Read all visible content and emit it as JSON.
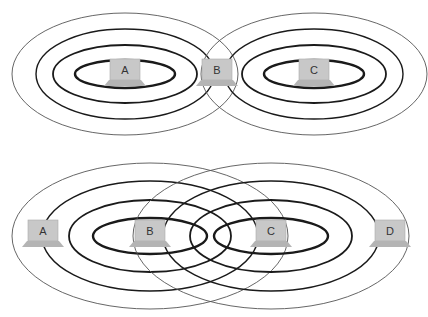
{
  "colors": {
    "background": "#ffffff",
    "ring_stroke": "#1a1a1a",
    "outer_ring_stroke": "#555555",
    "laptop_screen": "#c8c8c8",
    "laptop_base": "#b4b4b4",
    "label_text": "#333333"
  },
  "diagrams": [
    {
      "name": "top-diagram",
      "description": "Two stations A and C with nested range rings; station B sits where their outer rings overlap",
      "ranges": [
        {
          "id": "A",
          "cx": 125,
          "cy": 74,
          "rings": [
            {
              "rx": 50,
              "ry": 14,
              "w": 2.4
            },
            {
              "rx": 72,
              "ry": 29,
              "w": 1.8
            },
            {
              "rx": 89,
              "ry": 45,
              "w": 1.4
            },
            {
              "rx": 113,
              "ry": 61,
              "w": 0.9
            }
          ]
        },
        {
          "id": "C",
          "cx": 314,
          "cy": 74,
          "rings": [
            {
              "rx": 50,
              "ry": 14,
              "w": 2.4
            },
            {
              "rx": 72,
              "ry": 29,
              "w": 1.8
            },
            {
              "rx": 89,
              "ry": 45,
              "w": 1.4
            },
            {
              "rx": 113,
              "ry": 61,
              "w": 0.9
            }
          ]
        }
      ],
      "stations": [
        {
          "label": "A",
          "x": 125,
          "y": 72
        },
        {
          "label": "B",
          "x": 217,
          "y": 72
        },
        {
          "label": "C",
          "x": 314,
          "y": 72
        }
      ]
    },
    {
      "name": "bottom-diagram",
      "description": "Two stations B and C with overlapping range rings; stations A and D at the outer edges",
      "ranges": [
        {
          "id": "B",
          "cx": 150,
          "cy": 236,
          "rings": [
            {
              "rx": 57,
              "ry": 18,
              "w": 2.4
            },
            {
              "rx": 81,
              "ry": 36,
              "w": 1.8
            },
            {
              "rx": 108,
              "ry": 55,
              "w": 1.4
            },
            {
              "rx": 138,
              "ry": 73,
              "w": 0.9
            }
          ]
        },
        {
          "id": "C",
          "cx": 271,
          "cy": 236,
          "rings": [
            {
              "rx": 57,
              "ry": 18,
              "w": 2.4
            },
            {
              "rx": 81,
              "ry": 36,
              "w": 1.8
            },
            {
              "rx": 108,
              "ry": 55,
              "w": 1.4
            },
            {
              "rx": 138,
              "ry": 73,
              "w": 0.9
            }
          ]
        }
      ],
      "stations": [
        {
          "label": "A",
          "x": 43,
          "y": 233
        },
        {
          "label": "B",
          "x": 150,
          "y": 233
        },
        {
          "label": "C",
          "x": 271,
          "y": 233
        },
        {
          "label": "D",
          "x": 390,
          "y": 233
        }
      ]
    }
  ]
}
